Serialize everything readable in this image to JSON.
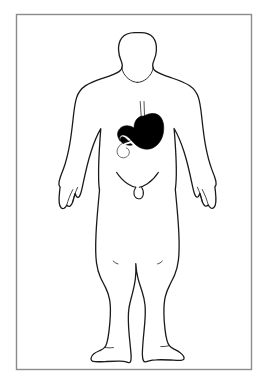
{
  "figure": {
    "view": "anterior",
    "alt_text": "Outline drawing of a standing human figure seen from the front, with the stomach, esophagus and duodenum drawn in solid black inside the upper abdomen.",
    "canvas": {
      "width": 269,
      "height": 384,
      "background_color": "#ffffff"
    },
    "frame": {
      "name": "border-rectangle",
      "x": 16,
      "y": 14,
      "width": 236,
      "height": 356,
      "stroke_color": "#8c8c8c",
      "stroke_width": 1.4,
      "fill_color": "#ffffff"
    },
    "body": {
      "name": "human-body-silhouette",
      "outline_color": "#1a1a1a",
      "fill_color": "#ffffff",
      "stroke_width": 1.3,
      "parts": [
        "head",
        "neck",
        "shoulders",
        "torso",
        "left-arm",
        "right-arm",
        "left-hand",
        "right-hand",
        "pelvis",
        "left-leg",
        "right-leg",
        "left-foot",
        "right-foot"
      ]
    },
    "organ": {
      "name": "stomach",
      "label": "Stomach",
      "fill_color": "#000000",
      "stroke_color": "#000000",
      "highlighted": true,
      "components": [
        {
          "name": "esophagus",
          "style": "two-thin-parallel-lines",
          "color": "#3a3a3a"
        },
        {
          "name": "fundus",
          "style": "solid-fill",
          "color": "#000000"
        },
        {
          "name": "body",
          "style": "solid-fill",
          "color": "#000000"
        },
        {
          "name": "pylorus",
          "style": "solid-fill",
          "color": "#000000"
        },
        {
          "name": "duodenum",
          "style": "white-outlined-hook",
          "color": "#ffffff"
        }
      ],
      "position": {
        "center_x": 144,
        "center_y": 128,
        "region": "upper-left-abdomen"
      }
    },
    "anatomy_lines": [
      {
        "name": "clavicle-line-left"
      },
      {
        "name": "clavicle-line-right"
      },
      {
        "name": "groin-crease-left"
      },
      {
        "name": "groin-crease-right"
      },
      {
        "name": "knee-crease-left"
      },
      {
        "name": "knee-crease-right"
      }
    ]
  }
}
